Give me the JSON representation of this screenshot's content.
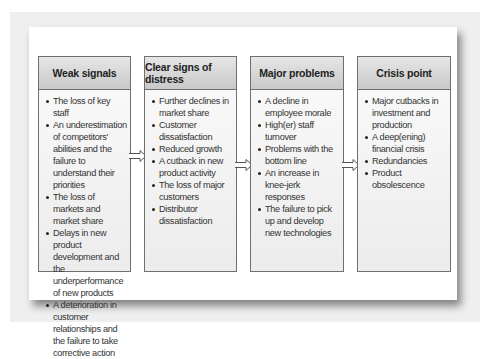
{
  "diagram": {
    "stages": [
      {
        "title": "Weak signals",
        "items": [
          "The loss of key staff",
          "An underestimation of competitors' abilities and the failure to understand their priorities",
          "The loss of markets and market share",
          "Delays in new product development and the underperformance of new products",
          "A deterioration in customer relationships and the failure to take corrective action"
        ]
      },
      {
        "title": "Clear signs of distress",
        "items": [
          "Further declines in market share",
          "Customer dissatisfaction",
          "Reduced growth",
          "A cutback in new product activity",
          "The loss of major customers",
          "Distributor dissatisfaction"
        ]
      },
      {
        "title": "Major problems",
        "items": [
          "A decline in employee morale",
          "High(er) staff turnover",
          "Problems with the bottom line",
          "An increase in knee-jerk responses",
          "The failure to pick up and develop new technologies"
        ]
      },
      {
        "title": "Crisis point",
        "items": [
          "Major cutbacks in investment and production",
          "A deep(ening) financial crisis",
          "Redundancies",
          "Product obsolescence"
        ]
      }
    ],
    "connector_icon": "right-arrow-outline"
  }
}
